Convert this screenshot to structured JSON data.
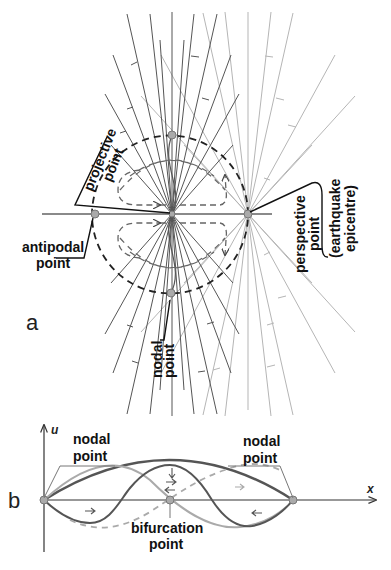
{
  "figure": {
    "panel_a": {
      "panel_label": "a",
      "labels": {
        "projective_point_1": "projective",
        "projective_point_2": "point",
        "antipodal_point_1": "antipodal",
        "antipodal_point_2": "point",
        "perspective_point_1": "perspective",
        "perspective_point_2": "point",
        "earthquake_1": "(earthquake",
        "earthquake_2": "epicentre)",
        "nodal_point_1": "nodal",
        "nodal_point_2": "point"
      },
      "points": {
        "nodal_center": [
          172,
          214
        ],
        "perspective": [
          248,
          214
        ],
        "antipodal": [
          95,
          214
        ],
        "top": [
          172,
          135
        ],
        "bottom": [
          171,
          293
        ]
      },
      "colors": {
        "dark_lines": "#555555",
        "light_lines": "#b0b0b0",
        "dashed_circle": "#222222",
        "dashed_loops": "#777777",
        "point_fill": "#aaaaaa"
      }
    },
    "panel_b": {
      "panel_label": "b",
      "y_axis_label": "u",
      "x_axis_label": "x",
      "labels": {
        "left_nodal_1": "nodal",
        "left_nodal_2": "point",
        "right_nodal_1": "nodal",
        "right_nodal_2": "point",
        "bifurcation_1": "bifurcation",
        "bifurcation_2": "point"
      },
      "points": {
        "left_node": [
          44,
          500
        ],
        "bifurcation": [
          170,
          500
        ],
        "right_node": [
          293,
          500
        ]
      }
    }
  }
}
